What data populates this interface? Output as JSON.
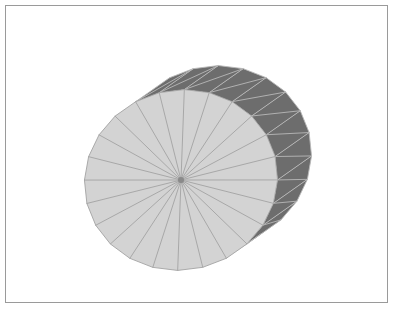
{
  "scene": {
    "title": "3D triangulated cylinder render",
    "background_color": "#ffffff",
    "frame": {
      "border_color": "#9a9a9a",
      "x": 5,
      "y": 5,
      "width": 383,
      "height": 298,
      "border_width": 1
    }
  },
  "model": {
    "name": "cylinder-mesh",
    "shape": "cylinder",
    "segments": 24,
    "cap_face": {
      "name": "front-cap",
      "fill_color": "#d3d3d3",
      "edge_color": "#a3a3a3",
      "center_x": 181,
      "center_y": 180,
      "radius_x": 97,
      "radius_y": 90,
      "rotation_deg": -14
    },
    "side_band": {
      "name": "lateral-surface",
      "fill_color": "#6d6d6d",
      "edge_color": "#b8b8b8",
      "offset_x": 34,
      "offset_y": -24,
      "triangulated": true
    },
    "hub": {
      "name": "center-vertex",
      "color": "#8a8a8a",
      "x": 181,
      "y": 180,
      "size": 3
    }
  },
  "render_stats": {
    "spoke_count": 24,
    "band_quad_count": 24,
    "light_gray": "#d3d3d3",
    "dark_gray": "#6d6d6d",
    "line_gray": "#a3a3a3",
    "band_line_gray": "#b8b8b8"
  }
}
